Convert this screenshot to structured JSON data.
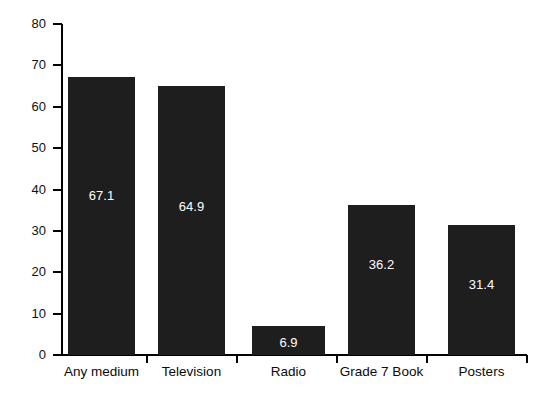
{
  "chart_data": {
    "type": "bar",
    "title": "",
    "subtitle": "",
    "xlabel": "",
    "ylabel": "",
    "categories": [
      "Any medium",
      "Television",
      "Radio",
      "Grade 7 Book",
      "Posters"
    ],
    "values": [
      67.1,
      64.9,
      6.9,
      36.2,
      31.4
    ],
    "value_labels": [
      "67.1",
      "64.9",
      "6.9",
      "36.2",
      "31.4"
    ],
    "ylim": [
      0,
      80
    ],
    "ytick_values": [
      0,
      10,
      20,
      30,
      40,
      50,
      60,
      70,
      80
    ],
    "ytick_labels": [
      "0",
      "10",
      "20",
      "30",
      "40",
      "50",
      "60",
      "70",
      "80"
    ],
    "grid": false,
    "legend": null,
    "legend_position": "none",
    "bar_color": "#1e1e1e",
    "value_label_color": "#ffffff",
    "axis_color": "#000000",
    "background_color": "#ffffff"
  }
}
